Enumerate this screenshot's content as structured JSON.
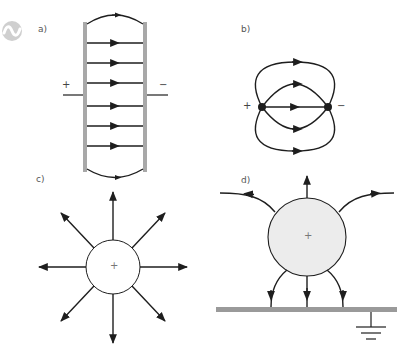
{
  "figure": {
    "logo": {
      "icon": "wave-circle-logo",
      "color": "#c8c8c8"
    },
    "colors": {
      "line": "#1e1e1e",
      "plate": "#a8a8a8",
      "sphere_fill_d": "#ececec",
      "sphere_fill_c": "#ffffff"
    },
    "panels": [
      {
        "id": "a",
        "label": "a)",
        "title": "Parallel plate capacitor",
        "left_sign": "+",
        "right_sign": "−",
        "field_lines": 8,
        "direction": "left-to-right"
      },
      {
        "id": "b",
        "label": "b)",
        "title": "Electric dipole",
        "left_sign": "+",
        "right_sign": "−",
        "field_lines": 5,
        "direction": "positive-to-negative"
      },
      {
        "id": "c",
        "label": "c)",
        "title": "Isolated positive charge",
        "center_sign": "+",
        "field_lines": 8,
        "direction": "radially-outward"
      },
      {
        "id": "d",
        "label": "d)",
        "title": "Positive charge above grounded plane",
        "center_sign": "+",
        "field_lines": 6,
        "ground_symbol": "earth-ground"
      }
    ]
  }
}
